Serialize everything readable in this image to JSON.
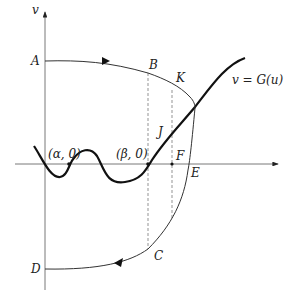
{
  "diagram": {
    "axes": {
      "vertical_label": "v",
      "horizontal_label": ""
    },
    "curve_label": "v = G(u)",
    "points": {
      "A": "A",
      "B": "B",
      "K": "K",
      "J": "J",
      "F": "F",
      "E": "E",
      "C": "C",
      "D": "D",
      "alpha": "(α, 0)",
      "beta": "(β, 0)"
    },
    "colors": {
      "line": "#222222",
      "background": "#ffffff"
    }
  }
}
